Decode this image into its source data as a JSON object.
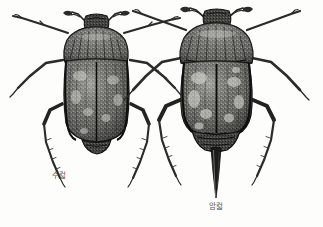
{
  "figure": {
    "kind": "scientific-illustration",
    "style": "grayscale stipple engraving",
    "background_color": "#fdfdfc",
    "ink_color": "#3a3a38",
    "caption_color": "#5a5a58",
    "specimens": [
      {
        "id": "male",
        "label": "수컯",
        "label_meaning": "male",
        "position": "left",
        "center_x": 97,
        "center_y": 95,
        "body_length_px": 150,
        "has_ovipositor": false,
        "features": [
          "lamellate-antennae",
          "pronotum",
          "elytra",
          "six-legs",
          "striated-elytra"
        ]
      },
      {
        "id": "female",
        "label": "암컯",
        "label_meaning": "female",
        "position": "right",
        "center_x": 216,
        "center_y": 100,
        "body_length_px": 190,
        "has_ovipositor": true,
        "ovipositor_length_px": 62,
        "features": [
          "lamellate-antennae",
          "pronotum",
          "elytra",
          "six-legs",
          "long-ovipositor",
          "mottled-elytra"
        ]
      }
    ]
  }
}
